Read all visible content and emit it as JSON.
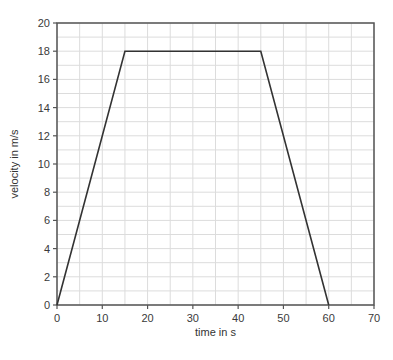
{
  "chart_data": {
    "type": "line",
    "title": "",
    "xlabel": "time in s",
    "ylabel": "velocity in m/s",
    "xlim": [
      0,
      70
    ],
    "ylim": [
      0,
      20
    ],
    "x_ticks": [
      0,
      10,
      20,
      30,
      40,
      50,
      60,
      70
    ],
    "y_ticks": [
      0,
      2,
      4,
      6,
      8,
      10,
      12,
      14,
      16,
      18,
      20
    ],
    "grid": true,
    "grid_minor_x_step": 5,
    "grid_minor_y_step": 1,
    "legend": null,
    "series": [
      {
        "name": "velocity",
        "color": "#333333",
        "x": [
          0,
          15,
          45,
          60
        ],
        "y": [
          0,
          18,
          18,
          0
        ]
      }
    ]
  },
  "layout": {
    "plot_left": 57,
    "plot_top": 23,
    "plot_right": 374,
    "plot_bottom": 305,
    "grid_color": "#dcdcdc",
    "axis_color": "#555555"
  }
}
